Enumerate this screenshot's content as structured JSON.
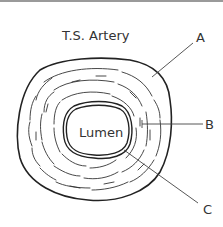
{
  "diagram": {
    "title": "T.S. Artery",
    "center_label": "Lumen",
    "labels": [
      {
        "id": "A",
        "text": "A",
        "points_to": "outer layer"
      },
      {
        "id": "B",
        "text": "B",
        "points_to": "middle muscular layer"
      },
      {
        "id": "C",
        "text": "C",
        "points_to": "inner lining"
      }
    ],
    "colors": {
      "stroke": "#222222",
      "leader": "#444444",
      "text": "#333333"
    }
  }
}
